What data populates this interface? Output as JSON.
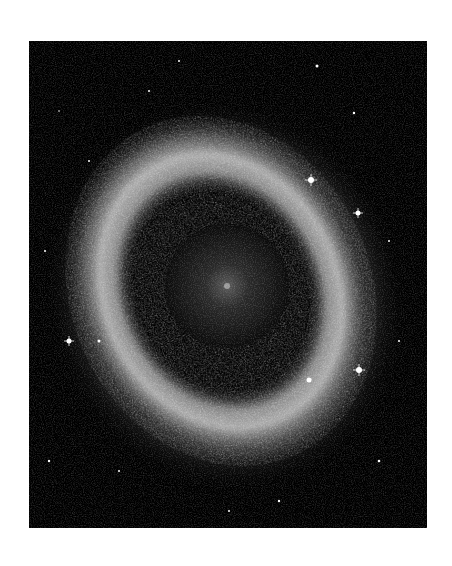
{
  "image": {
    "subject": "Helix Nebula",
    "alt": "Grayscale astronomical photograph of the Helix Nebula, a ring-shaped planetary nebula resembling an eye, surrounded by stars on a black background",
    "background_color": "#ffffff",
    "panel_color": "#000000"
  }
}
